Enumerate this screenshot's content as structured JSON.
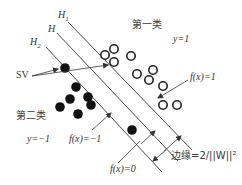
{
  "diagram": {
    "type": "svm-margin-illustration",
    "lines": {
      "h1": {
        "label": "H",
        "sub": "1",
        "x1": 68,
        "y1": 22,
        "x2": 192,
        "y2": 150
      },
      "h": {
        "label": "H",
        "x1": 57,
        "y1": 33,
        "x2": 178,
        "y2": 161
      },
      "h2": {
        "label": "H",
        "sub": "2",
        "x1": 46,
        "y1": 47,
        "x2": 162,
        "y2": 172
      }
    },
    "class1": {
      "label": "第一类",
      "y_label": "y=1",
      "marker": "open-circle",
      "points": [
        [
          105,
          55
        ],
        [
          114,
          49
        ],
        [
          114,
          62
        ],
        [
          131,
          56
        ],
        [
          137,
          74
        ],
        [
          153,
          70
        ],
        [
          149,
          80
        ],
        [
          163,
          86
        ],
        [
          163,
          105
        ],
        [
          177,
          105
        ]
      ]
    },
    "class2": {
      "label": "第二类",
      "y_label": "y=−1",
      "marker": "filled-circle",
      "points": [
        [
          65,
          68
        ],
        [
          76,
          87
        ],
        [
          88,
          97
        ],
        [
          70,
          99
        ],
        [
          60,
          107
        ],
        [
          91,
          105
        ],
        [
          78,
          114
        ],
        [
          132,
          130
        ]
      ]
    },
    "annotations": {
      "sv": "SV",
      "f_pos": "f(x)=1",
      "f_neg": "f(x)=−1",
      "f_zero": "f(x)=0",
      "margin": "边缘=2/||W||²"
    },
    "colors": {
      "line": "#333333",
      "point_fill": "#111111",
      "text": "#333333"
    }
  }
}
